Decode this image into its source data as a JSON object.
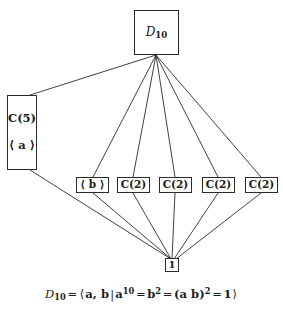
{
  "figure": {
    "background_color": "#ffffff",
    "line_color": "#2b2b2b",
    "nodes": {
      "top": {
        "label": "D",
        "subscript": "10",
        "name": "dihedral-group-d10"
      },
      "left": {
        "label": "C(5)",
        "generator": "⟨ a ⟩",
        "name": "cyclic-group-c5"
      },
      "middle": [
        {
          "label": "⟨ b ⟩",
          "name": "subgroup-b"
        },
        {
          "label": "C(2)",
          "name": "cyclic-group-c2-1"
        },
        {
          "label": "C(2)",
          "name": "cyclic-group-c2-2"
        },
        {
          "label": "C(2)",
          "name": "cyclic-group-c2-3"
        },
        {
          "label": "C(2)",
          "name": "cyclic-group-c2-4"
        }
      ],
      "bottom": {
        "label": "1",
        "name": "trivial-subgroup"
      }
    },
    "presentation": {
      "group": "D",
      "group_subscript": "10",
      "equals": "=",
      "open_angle": "⟨",
      "generators": "a, b",
      "bar": "|",
      "relation_1_base": "a",
      "relation_1_exponent": "10",
      "relation_2_base": "b",
      "relation_2_exponent": "2",
      "relation_3_base": "(a b)",
      "relation_3_exponent": "2",
      "identity": "1",
      "close_angle": "⟩",
      "full_text": "D10 = ⟨ a, b | a^10 = b^2 = (ab)^2 = 1 ⟩"
    }
  }
}
